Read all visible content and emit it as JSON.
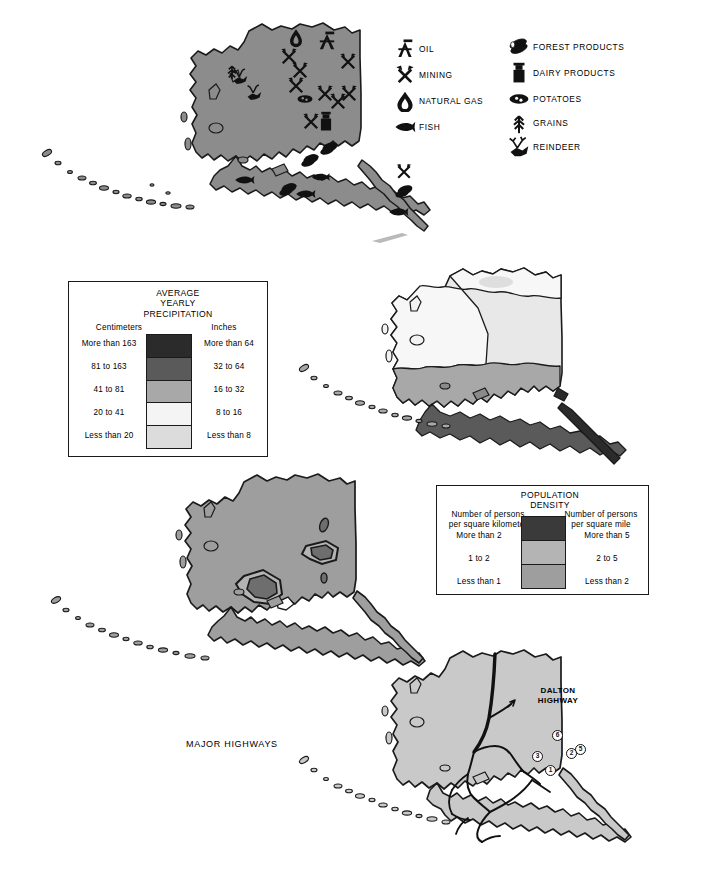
{
  "page": {
    "background": "#ffffff",
    "width": 706,
    "height": 884
  },
  "colors": {
    "land_base": "#8c8c8c",
    "outline": "#1a1a1a",
    "precip_more_than_163": "#2b2b2b",
    "precip_81_163": "#5a5a5a",
    "precip_41_81": "#a8a8a8",
    "precip_20_41": "#f4f4f4",
    "precip_less_20": "#dcdcdc",
    "pop_more_than_2": "#3a3a3a",
    "pop_1_to_2": "#b4b4b4",
    "pop_less_than_1": "#9e9e9e"
  },
  "resources_map": {
    "name": "Alaska natural resources map",
    "key": {
      "left_column": [
        {
          "icon": "oil-derrick-icon",
          "label": "OIL"
        },
        {
          "icon": "crossed-pickaxes-icon",
          "label": "MINING"
        },
        {
          "icon": "gas-flame-icon",
          "label": "NATURAL GAS"
        },
        {
          "icon": "fish-icon",
          "label": "FISH"
        }
      ],
      "right_column": [
        {
          "icon": "logs-icon",
          "label": "FOREST PRODUCTS"
        },
        {
          "icon": "milk-can-icon",
          "label": "DAIRY PRODUCTS"
        },
        {
          "icon": "potato-icon",
          "label": "POTATOES"
        },
        {
          "icon": "grain-stalk-icon",
          "label": "GRAINS"
        },
        {
          "icon": "reindeer-icon",
          "label": "REINDEER"
        }
      ]
    },
    "plotted_symbols": [
      {
        "icon": "gas-flame-icon",
        "x": 296,
        "y": 37
      },
      {
        "icon": "oil-derrick-icon",
        "x": 327,
        "y": 42
      },
      {
        "icon": "crossed-pickaxes-icon",
        "x": 289,
        "y": 57
      },
      {
        "icon": "crossed-pickaxes-icon",
        "x": 300,
        "y": 71
      },
      {
        "icon": "crossed-pickaxes-icon",
        "x": 348,
        "y": 62
      },
      {
        "icon": "crossed-pickaxes-icon",
        "x": 296,
        "y": 86
      },
      {
        "icon": "crossed-pickaxes-icon",
        "x": 325,
        "y": 94
      },
      {
        "icon": "crossed-pickaxes-icon",
        "x": 338,
        "y": 102
      },
      {
        "icon": "crossed-pickaxes-icon",
        "x": 349,
        "y": 94
      },
      {
        "icon": "crossed-pickaxes-icon",
        "x": 311,
        "y": 122
      },
      {
        "icon": "milk-can-icon",
        "x": 326,
        "y": 122
      },
      {
        "icon": "potato-icon",
        "x": 305,
        "y": 99
      },
      {
        "icon": "grain-stalk-icon",
        "x": 232,
        "y": 71
      },
      {
        "icon": "reindeer-icon",
        "x": 240,
        "y": 76
      },
      {
        "icon": "reindeer-icon",
        "x": 254,
        "y": 92
      },
      {
        "icon": "logs-icon",
        "x": 330,
        "y": 147
      },
      {
        "icon": "logs-icon",
        "x": 311,
        "y": 159
      },
      {
        "icon": "logs-icon",
        "x": 289,
        "y": 188
      },
      {
        "icon": "fish-icon",
        "x": 244,
        "y": 180
      },
      {
        "icon": "fish-icon",
        "x": 305,
        "y": 194
      },
      {
        "icon": "fish-icon",
        "x": 320,
        "y": 177
      },
      {
        "icon": "fish-icon",
        "x": 398,
        "y": 212
      },
      {
        "icon": "logs-icon",
        "x": 405,
        "y": 190
      },
      {
        "icon": "crossed-pickaxes-icon",
        "x": 404,
        "y": 172
      }
    ]
  },
  "precipitation_legend": {
    "title_line1": "AVERAGE",
    "title_line2": "YEARLY",
    "title_line3": "PRECIPITATION",
    "left_heading": "Centimeters",
    "right_heading": "Inches",
    "rows": [
      {
        "centimeters": "More than 163",
        "inches": "More than 64",
        "color": "#2b2b2b"
      },
      {
        "centimeters": "81 to 163",
        "inches": "32 to 64",
        "color": "#5a5a5a"
      },
      {
        "centimeters": "41 to 81",
        "inches": "16 to 32",
        "color": "#a8a8a8"
      },
      {
        "centimeters": "20 to 41",
        "inches": "8 to 16",
        "color": "#f4f4f4"
      },
      {
        "centimeters": "Less than 20",
        "inches": "Less than 8",
        "color": "#dcdcdc"
      }
    ]
  },
  "population_legend": {
    "title_line1": "POPULATION",
    "title_line2": "DENSITY",
    "left_heading_line1": "Number of persons",
    "left_heading_line2": "per square kilometer",
    "right_heading_line1": "Number of persons",
    "right_heading_line2": "per square mile",
    "rows": [
      {
        "per_km2": "More than 2",
        "per_mi2": "More than 5",
        "color": "#3a3a3a"
      },
      {
        "per_km2": "1 to 2",
        "per_mi2": "2 to 5",
        "color": "#b4b4b4"
      },
      {
        "per_km2": "Less than 1",
        "per_mi2": "Less than 2",
        "color": "#9e9e9e"
      }
    ]
  },
  "highways_map": {
    "caption": "MAJOR HIGHWAYS",
    "named_highway_line1": "DALTON",
    "named_highway_line2": "HIGHWAY",
    "route_shields": [
      {
        "number": "6",
        "x": 557,
        "y": 735
      },
      {
        "number": "5",
        "x": 578,
        "y": 748
      },
      {
        "number": "2",
        "x": 570,
        "y": 752
      },
      {
        "number": "3",
        "x": 536,
        "y": 755
      },
      {
        "number": "1",
        "x": 549,
        "y": 769
      }
    ]
  }
}
